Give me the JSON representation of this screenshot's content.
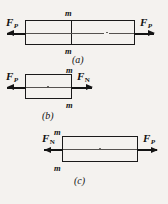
{
  "figure": {
    "background_color": "#f4f2ef",
    "ink_color": "#141414",
    "axis_color": "#55524f",
    "panels": [
      {
        "id": "a",
        "caption": "(a)",
        "section_labels": {
          "top": "m",
          "bottom": "m"
        },
        "forces": [
          {
            "name": "force-left",
            "label": "F",
            "subscript": "P",
            "direction": "left"
          },
          {
            "name": "force-right",
            "label": "F",
            "subscript": "P",
            "direction": "right"
          }
        ]
      },
      {
        "id": "b",
        "caption": "(b)",
        "section_labels": {
          "top": "m",
          "bottom": "m"
        },
        "forces": [
          {
            "name": "force-left",
            "label": "F",
            "subscript": "P",
            "direction": "left"
          },
          {
            "name": "force-right",
            "label": "F",
            "subscript": "N",
            "direction": "right"
          }
        ]
      },
      {
        "id": "c",
        "caption": "(c)",
        "section_labels": {
          "top": "m",
          "bottom": "m"
        },
        "forces": [
          {
            "name": "force-left",
            "label": "F",
            "subscript": "N",
            "direction": "left"
          },
          {
            "name": "force-right",
            "label": "F",
            "subscript": "P",
            "direction": "right"
          }
        ]
      }
    ]
  }
}
